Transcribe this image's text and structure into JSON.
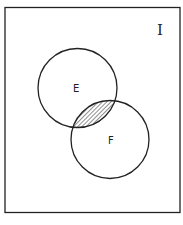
{
  "diagram": {
    "type": "venn",
    "universe_label": "I",
    "sets": [
      {
        "name": "E",
        "label": "E"
      },
      {
        "name": "F",
        "label": "F"
      }
    ],
    "shaded_region": "E ∩ F",
    "colors": {
      "stroke": "#222222",
      "background": "#ffffff",
      "hatch": "#222222"
    }
  }
}
